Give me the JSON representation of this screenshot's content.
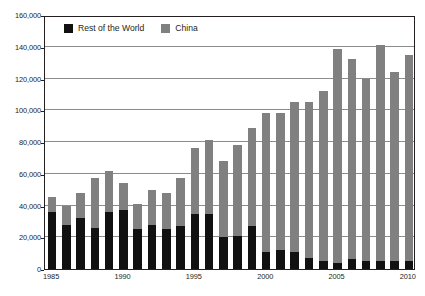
{
  "chart_data": {
    "type": "bar",
    "subtype": "stacked-vertical-bar",
    "title": "",
    "xlabel": "",
    "ylabel": "",
    "ylim": [
      0,
      160000
    ],
    "yticks": [
      0,
      20000,
      40000,
      60000,
      80000,
      100000,
      120000,
      140000,
      160000
    ],
    "ytick_labels": [
      "0",
      "20,000",
      "40,000",
      "60,000",
      "80,000",
      "100,000",
      "120,000",
      "140,000",
      "160,000"
    ],
    "grid": true,
    "grid_axis": "y",
    "legend_position": "top-left-inside",
    "categories": [
      "1985",
      "1986",
      "1987",
      "1988",
      "1989",
      "1990",
      "1991",
      "1992",
      "1993",
      "1994",
      "1995",
      "1996",
      "1997",
      "1998",
      "1999",
      "2000",
      "2001",
      "2002",
      "2003",
      "2004",
      "2005",
      "2006",
      "2007",
      "2008",
      "2009",
      "2010"
    ],
    "xtick_labels": [
      "1985",
      "1990",
      "1995",
      "2000",
      "2005",
      "2010"
    ],
    "xtick_categories": [
      "1985",
      "1990",
      "1995",
      "2000",
      "2005",
      "2010"
    ],
    "series": [
      {
        "name": "Rest of the World",
        "color": "#111111",
        "values": [
          36000,
          28000,
          32000,
          26000,
          36000,
          37000,
          25000,
          28000,
          25000,
          27000,
          34500,
          34500,
          20000,
          21000,
          27000,
          10500,
          12000,
          10500,
          7000,
          5000,
          4000,
          6000,
          5000,
          5000,
          5000,
          5000
        ]
      },
      {
        "name": "China",
        "color": "#808080",
        "values": [
          9500,
          12000,
          16000,
          31500,
          26000,
          17000,
          16000,
          22000,
          23000,
          30500,
          41500,
          47000,
          48000,
          57000,
          62000,
          87500,
          86000,
          94500,
          98000,
          107000,
          134500,
          126000,
          115000,
          136000,
          119000,
          130000
        ]
      }
    ],
    "totals": [
      45500,
      40000,
      48000,
      57500,
      62000,
      54000,
      41000,
      50000,
      48000,
      57500,
      76000,
      81500,
      68000,
      78000,
      89000,
      98000,
      98000,
      105000,
      105000,
      112000,
      138500,
      132000,
      120000,
      141000,
      124000,
      135000
    ],
    "legend": [
      {
        "label": "Rest of the World",
        "color": "#111111"
      },
      {
        "label": "China",
        "color": "#808080"
      }
    ]
  }
}
